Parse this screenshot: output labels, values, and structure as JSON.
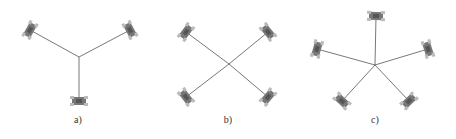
{
  "figure": {
    "panels": [
      {
        "label": "a)",
        "label_pos": [
          78,
          122
        ],
        "center": [
          79,
          57
        ],
        "robots": [
          [
            30,
            30
          ],
          [
            130,
            30
          ],
          [
            79,
            101
          ]
        ]
      },
      {
        "label": "b)",
        "label_pos": [
          228,
          122
        ],
        "center": [
          229,
          64
        ],
        "robots": [
          [
            186,
            32
          ],
          [
            268,
            32
          ],
          [
            186,
            97
          ],
          [
            268,
            97
          ]
        ]
      },
      {
        "label": "c)",
        "label_pos": [
          375,
          122
        ],
        "center": [
          375,
          65
        ],
        "robots": [
          [
            376,
            16
          ],
          [
            317,
            49
          ],
          [
            428,
            49
          ],
          [
            342,
            101
          ],
          [
            409,
            101
          ]
        ]
      }
    ],
    "colors": {
      "line": "#555555",
      "robot": "#777777",
      "robot_light": "#bbbbbb"
    }
  }
}
